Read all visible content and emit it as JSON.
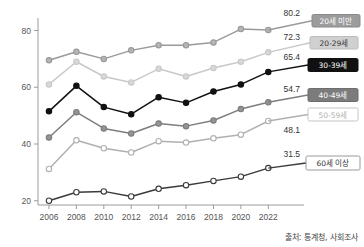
{
  "chart_data": {
    "type": "line",
    "title": "",
    "xlabel": "",
    "ylabel": "",
    "x": [
      2006,
      2008,
      2010,
      2012,
      2014,
      2016,
      2018,
      2020,
      2022
    ],
    "xticklabels": [
      "2006",
      "2008",
      "2010",
      "2012",
      "2014",
      "2016",
      "2018",
      "2020",
      "2022"
    ],
    "yticks": [
      20,
      40,
      60,
      80
    ],
    "yticklabels": [
      "20",
      "40",
      "60",
      "80"
    ],
    "ylim": [
      18.5,
      83.0
    ],
    "xlim": [
      2005.2,
      2023.0
    ],
    "grid": false,
    "legend_position": "right-inline-labels",
    "series": [
      {
        "name": "20세 미만",
        "values": [
          69.5,
          72.5,
          70.0,
          73.0,
          74.8,
          74.8,
          75.8,
          80.5,
          80.2
        ],
        "end_value_label": "80.2",
        "color": "#9a9a9a",
        "marker_fill": "#b5b5b5",
        "label_bg": "#9c9c9c",
        "label_fg": "#ffffff",
        "label_border": "#8a8a8a"
      },
      {
        "name": "20-29세",
        "values": [
          61.0,
          69.0,
          63.8,
          61.7,
          66.5,
          63.8,
          66.8,
          69.0,
          72.3
        ],
        "end_value_label": "72.3",
        "color": "#c9c9c9",
        "marker_fill": "#d8d8d8",
        "label_bg": "#d0d0d0",
        "label_fg": "#333333",
        "label_border": "#bdbdbd"
      },
      {
        "name": "30-39세",
        "values": [
          51.5,
          60.5,
          53.0,
          50.5,
          56.5,
          54.5,
          58.5,
          61.0,
          65.4
        ],
        "end_value_label": "65.4",
        "color": "#111111",
        "marker_fill": "#111111",
        "label_bg": "#111111",
        "label_fg": "#ffffff",
        "label_border": "#111111"
      },
      {
        "name": "40-49세",
        "values": [
          42.3,
          51.2,
          45.5,
          43.7,
          47.2,
          46.3,
          48.3,
          52.3,
          54.7
        ],
        "end_value_label": "54.7",
        "color": "#7d7d7d",
        "marker_fill": "#949494",
        "label_bg": "#7c7c7c",
        "label_fg": "#ffffff",
        "label_border": "#6e6e6e"
      },
      {
        "name": "50-59세",
        "values": [
          31.2,
          41.3,
          38.5,
          37.0,
          41.0,
          40.5,
          42.0,
          43.3,
          48.1
        ],
        "end_value_label": "48.1",
        "color": "#b0b0b0",
        "marker_fill": "#ffffff",
        "label_bg": "#ffffff",
        "label_fg": "#b0b0b0",
        "label_border": "#c4c4c4"
      },
      {
        "name": "60세 이상",
        "values": [
          20.0,
          23.0,
          23.3,
          21.5,
          24.2,
          25.5,
          27.0,
          28.5,
          31.5
        ],
        "end_value_label": "31.5",
        "color": "#3a3a3a",
        "marker_fill": "#ffffff",
        "label_bg": "#ffffff",
        "label_fg": "#333333",
        "label_border": "#999999"
      }
    ],
    "annotations": [
      "80.2",
      "72.3",
      "65.4",
      "54.7",
      "48.1",
      "31.5"
    ]
  },
  "source": {
    "text": "출처: 통계청, 사회조사"
  }
}
